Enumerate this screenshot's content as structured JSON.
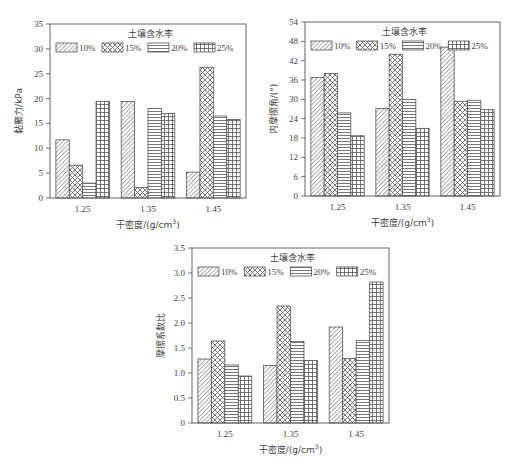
{
  "legend": {
    "title": "土壤含水率",
    "entries": [
      {
        "label": "10%",
        "pattern": "diag"
      },
      {
        "label": "15%",
        "pattern": "cross"
      },
      {
        "label": "20%",
        "pattern": "hlines"
      },
      {
        "label": "25%",
        "pattern": "grid"
      }
    ]
  },
  "colors": {
    "stroke": "#555555",
    "background": "#ffffff",
    "text": "#444444"
  },
  "chart_data": [
    {
      "type": "bar",
      "title": "",
      "xlabel": "干密度/(g/cm³)",
      "ylabel": "黏聚力/kPa",
      "categories": [
        "1.25",
        "1.35",
        "1.45"
      ],
      "ylim": [
        0,
        35
      ],
      "yticks": [
        0,
        5,
        10,
        15,
        20,
        25,
        30,
        35
      ],
      "grid": false,
      "legend_position": "top-inside",
      "series": [
        {
          "name": "10%",
          "values": [
            11.7,
            19.4,
            5.2
          ]
        },
        {
          "name": "15%",
          "values": [
            6.6,
            2.1,
            26.3
          ]
        },
        {
          "name": "20%",
          "values": [
            3.0,
            18.0,
            16.5
          ]
        },
        {
          "name": "25%",
          "values": [
            19.4,
            17.0,
            15.8
          ]
        }
      ]
    },
    {
      "type": "bar",
      "title": "",
      "xlabel": "干密度/(g/cm³)",
      "ylabel": "内摩擦角/(°)",
      "categories": [
        "1.25",
        "1.35",
        "1.45"
      ],
      "ylim": [
        0,
        54
      ],
      "yticks": [
        0,
        6,
        12,
        18,
        24,
        30,
        36,
        42,
        48,
        54
      ],
      "grid": false,
      "legend_position": "top-inside",
      "series": [
        {
          "name": "10%",
          "values": [
            36.8,
            27.2,
            46.2
          ]
        },
        {
          "name": "15%",
          "values": [
            38.0,
            44.0,
            29.4
          ]
        },
        {
          "name": "20%",
          "values": [
            25.8,
            30.0,
            29.7
          ]
        },
        {
          "name": "25%",
          "values": [
            18.7,
            21.0,
            26.8
          ]
        }
      ]
    },
    {
      "type": "bar",
      "title": "",
      "xlabel": "干密度/(g/cm³)",
      "ylabel": "摩擦系数比",
      "categories": [
        "1.25",
        "1.35",
        "1.45"
      ],
      "ylim": [
        0,
        3.5
      ],
      "yticks": [
        "0",
        "0.5",
        "1.0",
        "1.5",
        "2.0",
        "2.5",
        "3.0",
        "3.5"
      ],
      "grid": false,
      "legend_position": "top-inside",
      "series": [
        {
          "name": "10%",
          "values": [
            1.28,
            1.15,
            1.92
          ]
        },
        {
          "name": "15%",
          "values": [
            1.64,
            2.34,
            1.29
          ]
        },
        {
          "name": "20%",
          "values": [
            1.16,
            1.63,
            1.65
          ]
        },
        {
          "name": "25%",
          "values": [
            0.94,
            1.25,
            2.82
          ]
        }
      ]
    }
  ]
}
